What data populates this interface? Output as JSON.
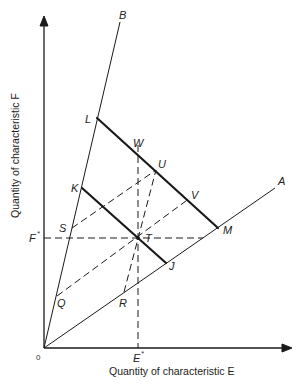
{
  "diagram": {
    "x_axis_label": "Quantity of characteristic E",
    "y_axis_label": "Quantity of characteristic F",
    "origin_label": "0",
    "rays": [
      {
        "label": "A",
        "from": [
          44,
          348
        ],
        "to": [
          275,
          188
        ]
      },
      {
        "label": "B",
        "from": [
          44,
          348
        ],
        "to": [
          120,
          22
        ]
      }
    ],
    "points": {
      "L": "L",
      "K": "K",
      "S": "S",
      "Q": "Q",
      "W": "W",
      "U": "U",
      "V": "V",
      "M": "M",
      "T": "T",
      "J": "J",
      "R": "R",
      "E_star": "E",
      "F_star": "F",
      "star": "*"
    },
    "solid_segments": [
      {
        "name": "budget-line-LM",
        "from": "L",
        "to": "M"
      },
      {
        "name": "budget-line-KJ",
        "from": "K",
        "to": "J"
      }
    ],
    "dashed_segments": [
      {
        "name": "SU",
        "from": "S",
        "to": "U"
      },
      {
        "name": "QV",
        "from": "Q",
        "to": "V"
      },
      {
        "name": "RU",
        "from": "R",
        "to": "U"
      },
      {
        "name": "W-E*",
        "from": "W",
        "to": "E*"
      },
      {
        "name": "F*-A",
        "from": "F*",
        "to": "ray A"
      }
    ],
    "colors": {
      "ink": "#1a1a1a",
      "background": "#ffffff"
    }
  }
}
